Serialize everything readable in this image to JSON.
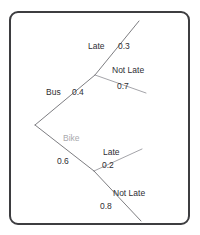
{
  "diagram": {
    "type": "probability-tree-diagram",
    "title_visible": false,
    "frame": {
      "style": "rounded-rectangle",
      "border_color": "#3d3d40",
      "background": "#ffffff"
    },
    "line_color": "#6e6e73",
    "root": {
      "label": "",
      "x": 35,
      "y": 125
    },
    "branches": [
      {
        "id": "bus",
        "label": "Bus",
        "probability": "0.4",
        "label_color": "#2e2e33",
        "label_x": 46,
        "label_y": 88,
        "prob_x": 72,
        "prob_y": 88,
        "from": {
          "x": 35,
          "y": 125
        },
        "to": {
          "x": 95,
          "y": 75
        },
        "children": [
          {
            "id": "bus-late",
            "label": "Late",
            "probability": "0.3",
            "label_x": 88,
            "label_y": 42,
            "prob_x": 118,
            "prob_y": 42,
            "from": {
              "x": 95,
              "y": 75
            },
            "to": {
              "x": 139,
              "y": 21
            }
          },
          {
            "id": "bus-not-late",
            "label": "Not Late",
            "probability": "0.7",
            "label_x": 112,
            "label_y": 66,
            "prob_x": 117,
            "prob_y": 82,
            "from": {
              "x": 95,
              "y": 75
            },
            "to": {
              "x": 146,
              "y": 93
            }
          }
        ]
      },
      {
        "id": "bike",
        "label": "Bike",
        "probability": "0.6",
        "label_color": "#a9a9ad",
        "label_x": 63,
        "label_y": 134,
        "prob_x": 57,
        "prob_y": 157,
        "from": {
          "x": 35,
          "y": 125
        },
        "to": {
          "x": 94,
          "y": 171
        },
        "children": [
          {
            "id": "bike-late",
            "label": "Late",
            "probability": "0.2",
            "label_x": 103,
            "label_y": 148,
            "prob_x": 102,
            "prob_y": 161,
            "from": {
              "x": 94,
              "y": 171
            },
            "to": {
              "x": 142,
              "y": 149
            }
          },
          {
            "id": "bike-not-late",
            "label": "Not Late",
            "probability": "0.8",
            "label_x": 113,
            "label_y": 189,
            "prob_x": 100,
            "prob_y": 202,
            "from": {
              "x": 94,
              "y": 171
            },
            "to": {
              "x": 141,
              "y": 221
            }
          }
        ]
      }
    ]
  }
}
